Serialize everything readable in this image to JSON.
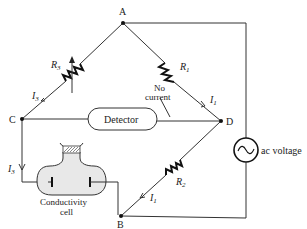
{
  "diagram": {
    "type": "Wheatstone bridge circuit with conductivity cell",
    "nodes": {
      "A": "A",
      "B": "B",
      "C": "C",
      "D": "D"
    },
    "components": {
      "r1": {
        "label": "R",
        "sub": "1"
      },
      "r2": {
        "label": "R",
        "sub": "2"
      },
      "r3": {
        "label": "R",
        "sub": "3"
      },
      "detector": "Detector",
      "cell_line1": "Conductivity",
      "cell_line2": "cell",
      "source": "ac voltage"
    },
    "currents": {
      "i1_top": {
        "label": "I",
        "sub": "1"
      },
      "i1_bottom": {
        "label": "I",
        "sub": "1"
      },
      "i3_top": {
        "label": "I",
        "sub": "3"
      },
      "i3_left": {
        "label": "I",
        "sub": "3"
      }
    },
    "annotation": {
      "line1": "No",
      "line2": "current"
    },
    "colors": {
      "wire": "#333333",
      "cell_fill": "#eeeeee",
      "background": "#ffffff"
    }
  }
}
